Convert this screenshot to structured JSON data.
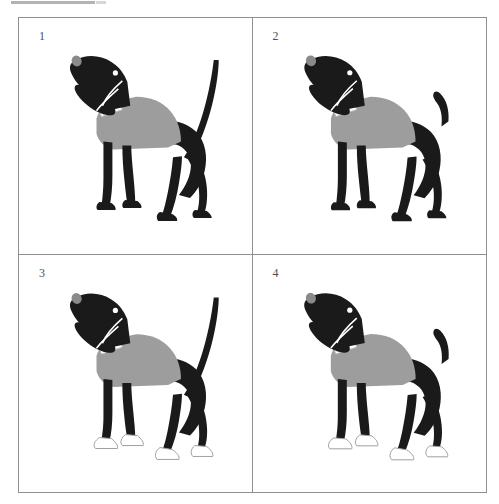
{
  "page": {
    "title_bar_visible": true,
    "background_color": "#ffffff",
    "border_color": "#8d8f91"
  },
  "palette": {
    "black": "#1a1a1a",
    "body_gray": "#9d9d9d",
    "nose_gray": "#8a8a8a",
    "white": "#ffffff",
    "paw_outline": "#9aa0a4",
    "number_color": "#4f4f4f"
  },
  "grid": {
    "rows": 2,
    "columns": 2,
    "panels": [
      {
        "number": "1",
        "name": "dog-long-tail-black-paws",
        "tail": "long-upright",
        "paws": "black",
        "body": "gray-sweater",
        "collar": "white",
        "head": "black",
        "nose": "gray"
      },
      {
        "number": "2",
        "name": "dog-short-tail-black-paws",
        "tail": "short-curved",
        "paws": "black",
        "body": "gray-sweater",
        "collar": "white",
        "head": "black",
        "nose": "gray"
      },
      {
        "number": "3",
        "name": "dog-long-tail-white-paws",
        "tail": "long-upright",
        "paws": "white",
        "body": "gray-sweater",
        "collar": "white",
        "head": "black",
        "nose": "gray"
      },
      {
        "number": "4",
        "name": "dog-short-tail-white-paws",
        "tail": "short-curved",
        "paws": "white",
        "body": "gray-sweater",
        "collar": "white",
        "head": "black",
        "nose": "gray"
      }
    ]
  }
}
